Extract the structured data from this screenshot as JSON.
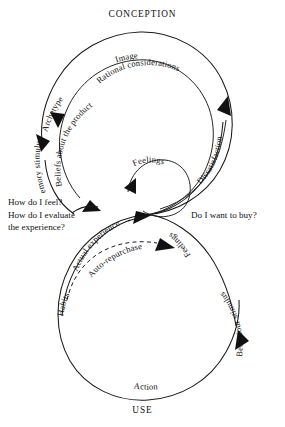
{
  "figure": {
    "title_top": "CONCEPTION",
    "title_bottom": "USE",
    "upper_circle": {
      "outer_labels": [
        "Image",
        "Archetype",
        "Memory stimulus"
      ],
      "inner_labels": [
        "Rational considerations",
        "Beliefs about the product"
      ],
      "right_label": "Dissatisfaction",
      "center_label": "Feelings"
    },
    "lower_circle": {
      "left_labels": [
        "Actual experience",
        "Habits"
      ],
      "dashed_label": "Auto-repurchase",
      "right_labels": [
        "Feelings",
        "Behaviour stimulus"
      ],
      "bottom_label": "Action"
    },
    "questions": {
      "left_line1": "How do I feel?",
      "left_line2": "How do I evaluate",
      "left_line3": "the experience?",
      "right": "Do I want to buy?"
    },
    "labels": {
      "image": "Image",
      "archetype": "Archetype",
      "memory_stimulus": "Memory stimulus",
      "rational_considerations": "Rational considerations",
      "beliefs_about_the_product": "Beliefs about the product",
      "dissatisfaction": "Dissatisfaction",
      "feelings_upper": "Feelings",
      "actual_experience": "Actual experience",
      "auto_repurchase": "Auto-repurchase",
      "habits": "Habits",
      "feelings_lower": "Feelings",
      "behaviour_stimulus": "Behaviour stimulus",
      "action": "Action"
    },
    "colors": {
      "stroke": "#1a1a1a",
      "text": "#111111",
      "background": "#ffffff"
    }
  }
}
